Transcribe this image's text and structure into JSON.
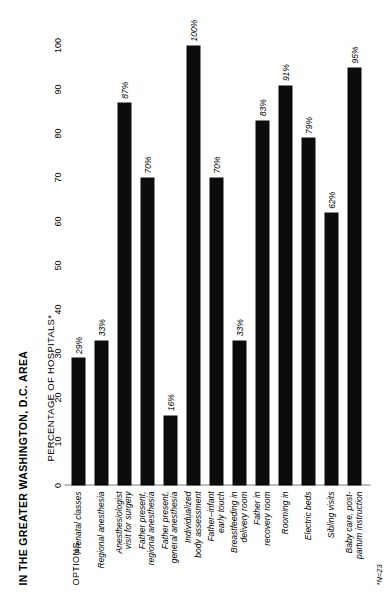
{
  "figure": {
    "title": "IN THE GREATER WASHINGTON, D.C. AREA",
    "axis_title": "PERCENTAGE OF HOSPITALS*",
    "options_header": "OPTIONS",
    "footnote": "*N=23"
  },
  "chart_data": {
    "type": "bar",
    "orientation": "horizontal",
    "title": "IN THE GREATER WASHINGTON, D.C. AREA",
    "xlabel": "PERCENTAGE OF HOSPITALS*",
    "ylabel": "OPTIONS",
    "xlim": [
      0,
      100
    ],
    "grid": false,
    "legend": "none",
    "bar_color": "#0c0c0c",
    "axis_color": "#7d7d7d",
    "tick_labels": [
      "0",
      "10",
      "20",
      "30",
      "40",
      "50",
      "60",
      "70",
      "80",
      "90",
      "100"
    ],
    "tick_values": [
      0,
      10,
      20,
      30,
      40,
      50,
      60,
      70,
      80,
      90,
      100
    ],
    "categories": [
      "Prenatal classes",
      "Regional anesthesia",
      "Anesthesiologist\nvisit for surgery",
      "Father present,\nregional anesthesia",
      "Father present,\ngeneral anesthesia",
      "Individualized\nbody assessment",
      "Father–infant\nearly touch",
      "Breastfeeding in\ndelivery room",
      "Father in\nrecovery room",
      "Rooming in",
      "Electric beds",
      "Sibling visits",
      "Baby care, post-\npartum instruction"
    ],
    "values": [
      29,
      33,
      87,
      70,
      16,
      100,
      70,
      33,
      83,
      91,
      79,
      62,
      95
    ],
    "value_labels": [
      "29%",
      "33%",
      "87%",
      "70%",
      "16%",
      "100%",
      "70%",
      "33%",
      "83%",
      "91%",
      "79%",
      "62%",
      "95%"
    ]
  }
}
